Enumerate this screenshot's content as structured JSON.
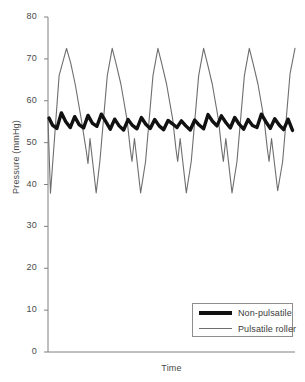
{
  "chart_data": {
    "type": "line",
    "title": "",
    "xlabel": "Time",
    "ylabel": "Pressure (mmHg)",
    "ylim": [
      0,
      80
    ],
    "yticks": [
      0,
      10,
      20,
      30,
      40,
      50,
      60,
      70,
      80
    ],
    "ytick_labels": [
      "0",
      "10",
      "20",
      "30",
      "40",
      "50",
      "60",
      "70",
      "80"
    ],
    "xlim": [
      0,
      100
    ],
    "xticks": [],
    "xtick_labels": [],
    "grid": false,
    "legend_position": "bottom-right",
    "colors": {
      "non_pulsatile": "#111111",
      "pulsatile_roller": "#6e6e6e",
      "axis": "#808080",
      "text": "#3a3a3a"
    },
    "series": [
      {
        "name": "Non-pulsatile",
        "color": "#111111",
        "line_width": 3.4,
        "x": [
          0.4,
          1.8,
          3.6,
          5.4,
          7.2,
          9.0,
          10.8,
          12.6,
          14.4,
          16.2,
          18.0,
          19.8,
          21.6,
          23.4,
          25.2,
          27.0,
          28.8,
          30.6,
          32.4,
          34.2,
          36.0,
          37.8,
          39.6,
          41.4,
          43.2,
          45.0,
          46.8,
          48.6,
          50.4,
          52.2,
          54.0,
          55.8,
          57.6,
          59.4,
          61.2,
          63.0,
          64.8,
          66.6,
          68.4,
          70.2,
          72.0,
          73.8,
          75.6,
          77.4,
          79.2,
          81.0,
          82.8,
          84.6,
          86.4,
          88.2,
          90.0,
          91.8,
          93.6,
          95.4,
          97.2,
          99.0
        ],
        "y": [
          55.9,
          54.2,
          53.4,
          57.1,
          55.0,
          53.6,
          56.2,
          54.3,
          53.5,
          56.5,
          54.6,
          53.9,
          56.8,
          55.0,
          53.2,
          55.6,
          54.0,
          53.0,
          55.5,
          54.1,
          53.3,
          56.0,
          54.4,
          53.4,
          55.5,
          54.0,
          53.1,
          55.3,
          54.5,
          53.6,
          55.2,
          54.0,
          53.0,
          55.4,
          54.2,
          53.3,
          56.7,
          55.1,
          54.0,
          56.4,
          54.8,
          53.5,
          56.0,
          54.4,
          53.2,
          55.5,
          54.1,
          53.6,
          56.8,
          55.0,
          53.4,
          55.7,
          54.2,
          53.1,
          55.6,
          52.9
        ]
      },
      {
        "name": "Pulsatile roller",
        "color": "#6e6e6e",
        "line_width": 1.1,
        "peak_value": 72.5,
        "trough_value": 37.9,
        "cycles": 6,
        "x": [
          0.0,
          1.0,
          4.5,
          7.5,
          9.2,
          11.0,
          13.5,
          15.5,
          16.2,
          17.0,
          19.5,
          21.0,
          24.0,
          26.0,
          27.5,
          29.5,
          32.0,
          33.3,
          34.0,
          35.0,
          37.5,
          39.5,
          42.5,
          44.5,
          46.0,
          48.0,
          50.5,
          51.8,
          52.5,
          53.5,
          56.0,
          58.0,
          61.0,
          63.0,
          64.5,
          66.5,
          69.0,
          70.3,
          71.0,
          72.0,
          74.5,
          76.5,
          79.5,
          81.5,
          83.0,
          85.0,
          87.5,
          88.8,
          89.5,
          90.5,
          93.0,
          95.0,
          98.0,
          100.0
        ],
        "y": [
          55.5,
          37.9,
          66.0,
          72.5,
          69.0,
          64.0,
          55.5,
          48.0,
          45.0,
          51.0,
          38.0,
          45.5,
          66.0,
          72.5,
          69.0,
          64.0,
          55.5,
          48.5,
          45.5,
          51.0,
          38.0,
          45.5,
          66.0,
          72.5,
          69.0,
          64.0,
          55.5,
          48.5,
          45.5,
          51.0,
          38.0,
          45.5,
          66.0,
          72.5,
          69.0,
          64.0,
          55.5,
          48.5,
          45.5,
          51.0,
          38.0,
          45.5,
          66.0,
          72.5,
          69.0,
          64.0,
          55.5,
          48.5,
          45.5,
          51.0,
          38.5,
          45.5,
          66.5,
          72.5
        ]
      }
    ]
  },
  "axes": {
    "ylabel": "Pressure (mmHg)",
    "xlabel": "Time"
  },
  "legend": {
    "entries": [
      {
        "label": "Non-pulsatile",
        "style": "thick",
        "color": "#111111"
      },
      {
        "label": "Pulsatile roller",
        "style": "thin",
        "color": "#6e6e6e"
      }
    ]
  }
}
